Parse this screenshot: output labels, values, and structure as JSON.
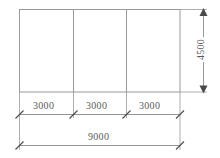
{
  "drawing": {
    "title": "Framed plan with bay dimensions",
    "units_note": "",
    "colors": {
      "line": "#9a9a9a",
      "dimension_line": "#8a8a8a",
      "text": "#5a5a5a",
      "background": "#ffffff"
    },
    "outline": {
      "name": "main-rectangle",
      "x": 19,
      "y": 9,
      "width": 161,
      "height": 83
    },
    "dividers": [
      {
        "name": "divider-1",
        "x": 73
      },
      {
        "name": "divider-2",
        "x": 126
      }
    ],
    "bay_dimensions": [
      {
        "label": "3000",
        "start_x": 19,
        "end_x": 73
      },
      {
        "label": "3000",
        "start_x": 73,
        "end_x": 126
      },
      {
        "label": "3000",
        "start_x": 126,
        "end_x": 180
      }
    ],
    "overall_dimension": {
      "label": "9000",
      "start_x": 19,
      "end_x": 180
    },
    "height_dimension": {
      "label": "4500",
      "start_y": 9,
      "end_y": 92,
      "orientation": "vertical"
    }
  }
}
